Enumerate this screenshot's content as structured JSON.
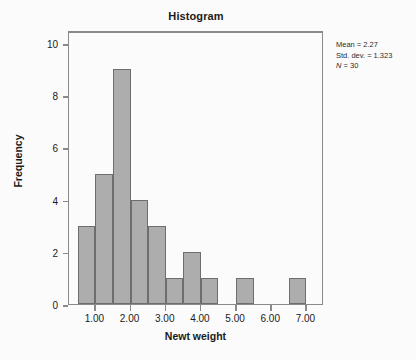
{
  "chart_data": {
    "type": "bar",
    "title": "Histogram",
    "xlabel": "Newt weight",
    "ylabel": "Frequency",
    "xlim": [
      0.25,
      7.5
    ],
    "ylim": [
      0,
      10.5
    ],
    "grid": false,
    "legend": "none",
    "bin_width": 0.5,
    "bin_starts": [
      0.5,
      1.0,
      1.5,
      2.0,
      2.5,
      3.0,
      3.5,
      4.0,
      4.5,
      5.0,
      5.5,
      6.0,
      6.5
    ],
    "categories": [
      "0.50-1.00",
      "1.00-1.50",
      "1.50-2.00",
      "2.00-2.50",
      "2.50-3.00",
      "3.00-3.50",
      "3.50-4.00",
      "4.00-4.50",
      "4.50-5.00",
      "5.00-5.50",
      "5.50-6.00",
      "6.00-6.50",
      "6.50-7.00"
    ],
    "values": [
      3,
      5,
      9,
      4,
      3,
      1,
      2,
      1,
      0,
      1,
      0,
      0,
      1
    ],
    "xticks": [
      1.0,
      2.0,
      3.0,
      4.0,
      5.0,
      6.0,
      7.0
    ],
    "xtick_labels": [
      "1.00",
      "2.00",
      "3.00",
      "4.00",
      "5.00",
      "6.00",
      "7.00"
    ],
    "yticks": [
      0,
      2,
      4,
      6,
      8,
      10
    ],
    "ytick_labels": [
      "0",
      "2",
      "4",
      "6",
      "8",
      "10"
    ],
    "bar_fill_color": "#adadad",
    "bar_edge_color": "#6e6e6e"
  },
  "annotations": {
    "mean_line": "Mean = 2.27",
    "stddev_line": "Std. dev. = 1.323",
    "n_symbol": "N",
    "n_value": " = 30"
  }
}
